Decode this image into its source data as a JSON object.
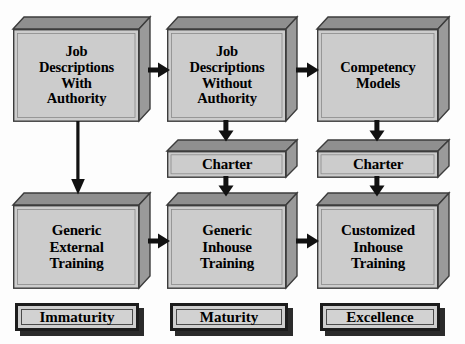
{
  "diagram": {
    "colors": {
      "box_face": "#cccccc",
      "box_side": "#9a9a9a",
      "box_top": "#8f8f8f",
      "outline": "#3c3c3c",
      "arrow": "#111111",
      "tag_border": "#1c1c1c",
      "tag_shadow": "#2b2b2b",
      "background": "#fdfdfd"
    },
    "columns": [
      {
        "id": "column-1",
        "tag": "Immaturity"
      },
      {
        "id": "column-2",
        "tag": "Maturity"
      },
      {
        "id": "column-3",
        "tag": "Excellence"
      }
    ],
    "nodes": {
      "r1c1": "Job\nDescriptions\nWith\nAuthority",
      "r1c2": "Job\nDescriptions\nWithout\nAuthority",
      "r1c3": "Competency\nModels",
      "r2c2": "Charter",
      "r2c3": "Charter",
      "r3c1": "Generic\nExternal\nTraining",
      "r3c2": "Generic\nInhouse\nTraining",
      "r3c3": "Customized\nInhouse\nTraining"
    },
    "edges": [
      {
        "id": "edge-r1c1-to-r1c2",
        "direction": "right"
      },
      {
        "id": "edge-r1c2-to-r1c3",
        "direction": "right"
      },
      {
        "id": "edge-r1c1-to-r3c1",
        "direction": "down"
      },
      {
        "id": "edge-r1c2-to-r2c2",
        "direction": "down"
      },
      {
        "id": "edge-r2c2-to-r3c2",
        "direction": "down"
      },
      {
        "id": "edge-r1c3-to-r2c3",
        "direction": "down"
      },
      {
        "id": "edge-r2c3-to-r3c3",
        "direction": "down"
      },
      {
        "id": "edge-r3c1-to-r3c2",
        "direction": "right"
      },
      {
        "id": "edge-r3c2-to-r3c3",
        "direction": "right"
      }
    ]
  }
}
